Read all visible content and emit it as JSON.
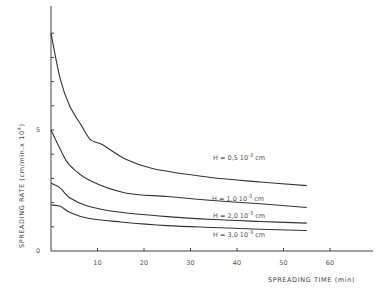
{
  "chart_data": {
    "type": "line",
    "title": "",
    "xlabel": "SPREADING TIME (min)",
    "ylabel": "SPREADING RATE (cm/min.x 10^4)",
    "xlim": [
      0,
      70
    ],
    "ylim": [
      0,
      9.5
    ],
    "x_ticks": [
      10,
      20,
      30,
      40,
      50,
      60
    ],
    "y_ticks_labeled": [
      0,
      5
    ],
    "y_minor_ticks": [
      1,
      2,
      3,
      4,
      6,
      7,
      8,
      9
    ],
    "grid": false,
    "legend": "inline labels",
    "series": [
      {
        "name": "H = 0,5 10^-3 cm",
        "label_text": "H = 0,5",
        "label_unit": "10",
        "label_exp": "-3",
        "label_cm": "cm",
        "x": [
          0,
          2,
          4,
          6.5,
          8.5,
          11,
          16,
          22,
          34,
          45,
          55
        ],
        "y": [
          9.0,
          7.1,
          6.0,
          5.2,
          4.6,
          4.4,
          3.8,
          3.4,
          3.05,
          2.85,
          2.7
        ]
      },
      {
        "name": "H = 1,0 10^-3 cm",
        "label_text": "H = 1,0",
        "label_unit": "10",
        "label_exp": "-3",
        "label_cm": "cm",
        "x": [
          0,
          2,
          4,
          8.5,
          16,
          25,
          34,
          45,
          55
        ],
        "y": [
          5.0,
          4.2,
          3.55,
          2.9,
          2.4,
          2.25,
          2.1,
          1.95,
          1.8
        ]
      },
      {
        "name": "H = 2,0 10^-3 cm",
        "label_text": "H = 2,0",
        "label_unit": "10",
        "label_exp": "-3",
        "label_cm": "cm",
        "x": [
          0,
          2,
          4,
          8,
          15,
          25,
          35,
          45,
          55
        ],
        "y": [
          2.8,
          2.6,
          2.2,
          1.85,
          1.6,
          1.42,
          1.3,
          1.22,
          1.15
        ]
      },
      {
        "name": "H = 3,0 10^-3 cm",
        "label_text": "H = 3,0",
        "label_unit": "10",
        "label_exp": "-3",
        "label_cm": "cm",
        "x": [
          0,
          2,
          4,
          8,
          15,
          25,
          35,
          45,
          55
        ],
        "y": [
          1.9,
          1.85,
          1.6,
          1.35,
          1.2,
          1.05,
          0.97,
          0.9,
          0.85
        ]
      }
    ]
  },
  "axes": {
    "x_label": "SPREADING  TIME (min)",
    "y_label": "SPREADING  RATE   (cm/min.x 10",
    "y_label_exp": "4",
    "y_label_close": ")"
  }
}
